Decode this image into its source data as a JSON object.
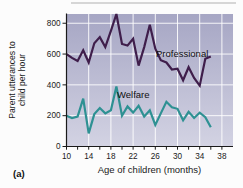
{
  "figure": {
    "panel_label": "(a)",
    "y_axis_label_line1": "Parent utterances to",
    "y_axis_label_line2": "child per hour",
    "x_axis_label": "Age of children (months)"
  },
  "colors": {
    "professional_line": "#3f1e4b",
    "welfare_line": "#2e9193",
    "plot_bg_top": "#a6a6c4",
    "plot_bg_bottom": "#d3d3e3",
    "gridline": "#ffffff",
    "axis": "#1a1a1a"
  },
  "chart_data": {
    "type": "line",
    "title": "",
    "xlabel": "Age of children (months)",
    "ylabel": "Parent utterances to child per hour",
    "x_ticks_labeled": [
      10,
      14,
      18,
      22,
      26,
      30,
      34,
      38
    ],
    "x_minor_tick_step": 2,
    "y_ticks": [
      0,
      200,
      400,
      600,
      800
    ],
    "xlim": [
      10,
      40
    ],
    "ylim": [
      0,
      860
    ],
    "grid": true,
    "legend_position": "inline-labels",
    "x": [
      10,
      11,
      12,
      13,
      14,
      15,
      16,
      17,
      18,
      19,
      20,
      21,
      22,
      23,
      24,
      25,
      26,
      27,
      28,
      29,
      30,
      31,
      32,
      33,
      34,
      35,
      36
    ],
    "series": [
      {
        "name": "Professional",
        "color": "#3f1e4b",
        "values": [
          600,
          575,
          555,
          625,
          545,
          670,
          710,
          645,
          750,
          860,
          665,
          655,
          700,
          525,
          645,
          790,
          635,
          560,
          545,
          500,
          505,
          430,
          515,
          445,
          395,
          570,
          585
        ]
      },
      {
        "name": "Welfare",
        "color": "#2e9193",
        "values": [
          200,
          185,
          195,
          310,
          85,
          210,
          250,
          215,
          235,
          390,
          200,
          260,
          220,
          265,
          195,
          235,
          140,
          215,
          290,
          255,
          245,
          170,
          225,
          185,
          220,
          190,
          125
        ]
      }
    ]
  }
}
